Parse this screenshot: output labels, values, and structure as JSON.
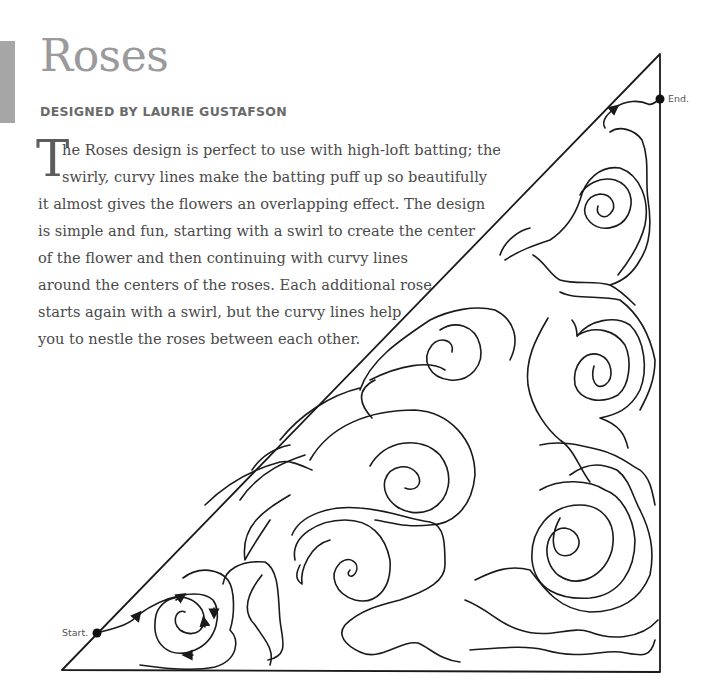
{
  "page": {
    "title": "Roses",
    "byline": "DESIGNED BY LAURIE GUSTAFSON",
    "drop_cap": "T",
    "body_lines": [
      "he Roses design is perfect to use with high-loft batting; the",
      "swirly, curvy lines make the batting puff up so beautifully",
      "it almost gives the flowers an overlapping effect. The design",
      "is simple and fun, starting with a swirl to create the center",
      "of the flower and then continuing with curvy lines",
      "around the centers of the roses. Each additional rose",
      "starts again with a swirl, but the curvy lines help",
      "you to nestle the roses between each other."
    ]
  },
  "diagram": {
    "start_label": "Start.",
    "end_label": "End.",
    "stroke_color": "#1a1a1a",
    "accent_bar_color": "#a6a6a6"
  }
}
